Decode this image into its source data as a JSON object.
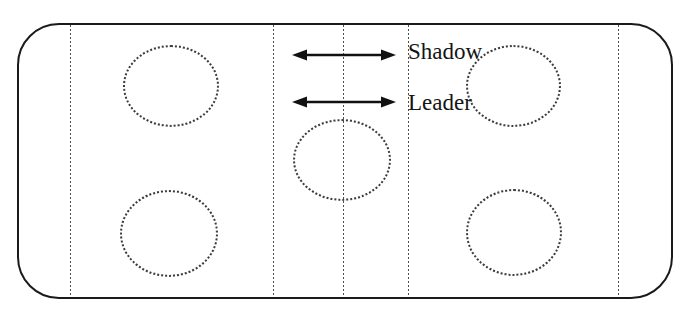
{
  "figure": {
    "type": "ice-rink-drill-diagram",
    "labels": {
      "shadow": "Shadow",
      "leader": "Leader"
    },
    "icons": [
      "shadow-double-arrow-icon",
      "leader-double-arrow-icon"
    ],
    "colors": {
      "background": "#ffffff",
      "rink_outline": "#1a1a1a",
      "dotted_lines": "#4d4d4d",
      "circles": "#3c3c3c",
      "arrows": "#111111",
      "text": "#141414"
    },
    "elements": {
      "faceoff_circles": 5,
      "vertical_dotted_lines": 5,
      "double_headed_arrows": 2
    }
  }
}
